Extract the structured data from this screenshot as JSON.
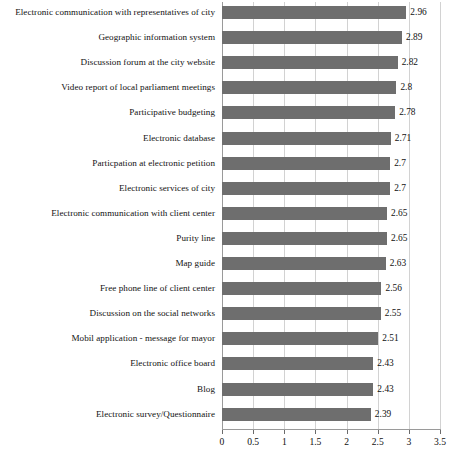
{
  "chart_data": {
    "type": "bar",
    "orientation": "horizontal",
    "title": "",
    "subtitle": "",
    "xlabel": "",
    "ylabel": "",
    "xlim": [
      0,
      3.5
    ],
    "xticks": [
      "0",
      "0.5",
      "1",
      "1.5",
      "2",
      "2.5",
      "3",
      "3.5"
    ],
    "xtick_values": [
      0,
      0.5,
      1,
      1.5,
      2,
      2.5,
      3,
      3.5
    ],
    "grid": true,
    "grid_axis": "x",
    "legend": false,
    "legend_position": "none",
    "bar_color": "#6e6e6e",
    "gridline_color": "#d2d2d2",
    "axis_color": "#9a9a9a",
    "data_labels": true,
    "categories": [
      "Electronic communication with representatives of city",
      "Geographic information system",
      "Discussion forum at the city website",
      "Video report of local parliament meetings",
      "Participative budgeting",
      "Electronic database",
      "Particpation at electronic petition",
      "Electronic services of city",
      "Electronic communication with client center",
      "Purity line",
      "Map guide",
      "Free phone line of client center",
      "Discussion on the social networks",
      "Mobil application - message for mayor",
      "Electronic office board",
      "Blog",
      "Electronic survey/Questionnaire"
    ],
    "values": [
      2.96,
      2.89,
      2.82,
      2.8,
      2.78,
      2.71,
      2.7,
      2.7,
      2.65,
      2.65,
      2.63,
      2.56,
      2.55,
      2.51,
      2.43,
      2.43,
      2.39
    ],
    "value_labels": [
      "2.96",
      "2.89",
      "2.82",
      "2.8",
      "2.78",
      "2.71",
      "2.7",
      "2.7",
      "2.65",
      "2.65",
      "2.63",
      "2.56",
      "2.55",
      "2.51",
      "2.43",
      "2.43",
      "2.39"
    ]
  }
}
